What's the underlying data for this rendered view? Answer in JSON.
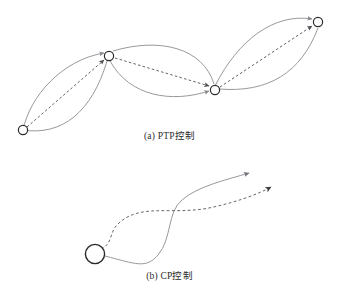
{
  "figure": {
    "background_color": "#ffffff",
    "line_color": "#8d8d92",
    "dash_color": "#55555a",
    "node_stroke_color": "#2a2a2a",
    "panels": [
      {
        "id": "ptp",
        "caption_prefix": "(a)",
        "caption_label": "PTP",
        "caption_suffix": "控制",
        "caption_full": "(a) PTP控制",
        "description": "point-to-point control path with four via nodes joined by lens shaped arcs and dashed straight segments",
        "nodes": [
          {
            "name": "node-1",
            "x": 23,
            "y": 130,
            "r": 5
          },
          {
            "name": "node-2",
            "x": 109,
            "y": 56,
            "r": 5
          },
          {
            "name": "node-3",
            "x": 215,
            "y": 90,
            "r": 5
          },
          {
            "name": "node-4",
            "x": 318,
            "y": 22,
            "r": 5
          }
        ],
        "segments": [
          {
            "name": "segment-1-2",
            "arc_upper": "M23,130 C30,96 62,60 104,53",
            "arc_lower": "M23,130 C62,136 92,112 107,61",
            "dashed": "M26,127 L105,59"
          },
          {
            "name": "segment-2-3",
            "arc_upper": "M112,52 C160,38 202,50 214,84",
            "arc_lower": "M111,61 C132,96 172,102 210,90",
            "dashed": "M114,58 L210,87"
          },
          {
            "name": "segment-3-4",
            "arc_upper": "M216,86 C240,40 275,14 313,19",
            "arc_lower": "M218,88 C268,92 300,74 317,28",
            "dashed": "M220,87 L314,25"
          }
        ]
      },
      {
        "id": "cp",
        "caption_prefix": "(b)",
        "caption_label": "CP",
        "caption_suffix": "控制",
        "caption_full": "(b) CP控制",
        "description": "continuous path control showing a solid commanded trajectory and a dashed actual trajectory leaving a start circle",
        "start_circle": {
          "name": "start-circle",
          "x": 95,
          "y": 254,
          "r": 10
        },
        "solid_path": "M105,255 C135,263 145,268 158,255 C172,240 168,212 182,200 C198,186 225,180 250,173",
        "dashed_path": "M101,249 C112,243 110,232 118,224 C128,214 140,212 150,211 C168,210 188,211 208,208 C232,204 256,195 272,186",
        "solid_arrow": {
          "name": "solid-arrow-head",
          "x": 252,
          "y": 172,
          "angle": -16
        },
        "dashed_arrow": {
          "name": "dashed-arrow-head",
          "x": 274,
          "y": 185,
          "angle": -29
        }
      }
    ]
  }
}
